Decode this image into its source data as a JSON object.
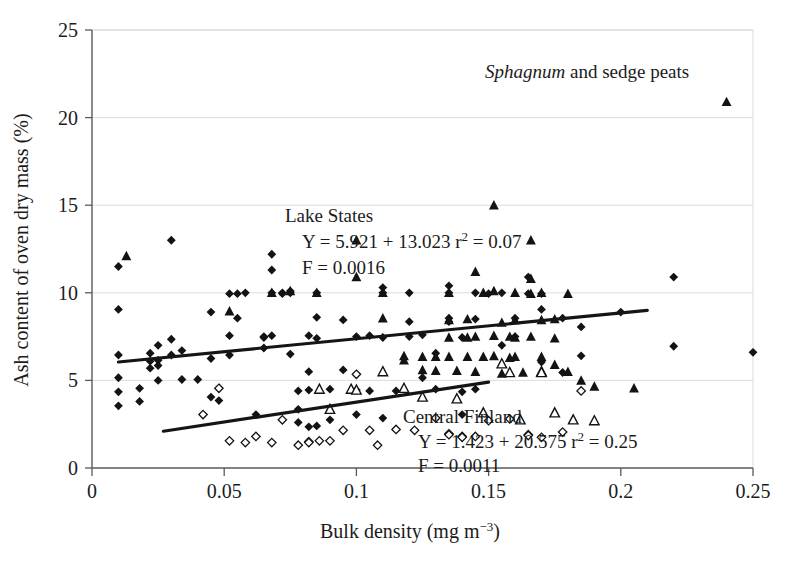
{
  "chart_data": {
    "type": "scatter",
    "title": "Sphagnum and sedge peats",
    "title_italic_word": "Sphagnum",
    "title_rest": " and sedge peats",
    "xlabel": "Bulk density (mg m−3)",
    "xlabel_base": "Bulk density (mg m",
    "xlabel_sup": "−3",
    "xlabel_tail": ")",
    "ylabel": "Ash content of oven dry mass (%)",
    "xlim": [
      0,
      0.25
    ],
    "ylim": [
      0,
      25
    ],
    "xticks": [
      0,
      0.05,
      0.1,
      0.15,
      0.2,
      0.25
    ],
    "xtick_labels": [
      "0",
      "0.05",
      "0.1",
      "0.15",
      "0.2",
      "0.25"
    ],
    "yticks": [
      0,
      5,
      10,
      15,
      20,
      25
    ],
    "ytick_labels": [
      "0",
      "5",
      "10",
      "15",
      "20",
      "25"
    ],
    "grid": "horizontal",
    "legend_position": "none",
    "annotations": [
      {
        "name": "lake-states",
        "lines": [
          "Lake States",
          "Y = 5.921 + 13.023  r2 = 0.07",
          "F = 0.0016"
        ],
        "label": "Lake States",
        "equation_prefix": "Y = 5.921 + 13.023  r",
        "equation_sup": "2",
        "equation_suffix": " = 0.07",
        "fstat": "F = 0.0016",
        "intercept": 5.921,
        "slope": 13.023,
        "r2": 0.07,
        "F": 0.0016
      },
      {
        "name": "central-finland",
        "lines": [
          "Central Finland",
          "Y = 1.423 + 20.575  r2 = 0.25",
          "F = 0.0011"
        ],
        "label": "Central Finland",
        "equation_prefix": "Y = 1.423 + 20.575  r",
        "equation_sup": "2",
        "equation_suffix": " = 0.25",
        "fstat": "F = 0.0011",
        "intercept": 1.423,
        "slope": 20.575,
        "r2": 0.25,
        "F": 0.0011
      }
    ],
    "trendlines": [
      {
        "name": "lake-states-fit",
        "x": [
          0.01,
          0.21
        ],
        "y": [
          6.05,
          9.0
        ]
      },
      {
        "name": "central-finland-fit",
        "x": [
          0.027,
          0.15
        ],
        "y": [
          2.1,
          4.9
        ]
      }
    ],
    "series": [
      {
        "name": "Lake States ash (filled diamond)",
        "marker": "filled-diamond",
        "points": [
          [
            0.01,
            11.5
          ],
          [
            0.01,
            9.05
          ],
          [
            0.01,
            6.45
          ],
          [
            0.01,
            5.15
          ],
          [
            0.01,
            4.35
          ],
          [
            0.01,
            3.55
          ],
          [
            0.018,
            4.55
          ],
          [
            0.018,
            3.8
          ],
          [
            0.022,
            6.55
          ],
          [
            0.022,
            6.1
          ],
          [
            0.022,
            5.7
          ],
          [
            0.025,
            7.0
          ],
          [
            0.025,
            6.15
          ],
          [
            0.025,
            5.85
          ],
          [
            0.025,
            5.0
          ],
          [
            0.03,
            13.0
          ],
          [
            0.03,
            7.35
          ],
          [
            0.03,
            6.45
          ],
          [
            0.034,
            6.7
          ],
          [
            0.034,
            5.05
          ],
          [
            0.04,
            5.05
          ],
          [
            0.045,
            8.9
          ],
          [
            0.045,
            6.25
          ],
          [
            0.045,
            4.05
          ],
          [
            0.048,
            3.85
          ],
          [
            0.052,
            9.95
          ],
          [
            0.052,
            7.55
          ],
          [
            0.052,
            6.45
          ],
          [
            0.055,
            9.95
          ],
          [
            0.055,
            8.55
          ],
          [
            0.058,
            10.0
          ],
          [
            0.062,
            3.05
          ],
          [
            0.065,
            7.5
          ],
          [
            0.065,
            7.45
          ],
          [
            0.065,
            6.85
          ],
          [
            0.068,
            12.2
          ],
          [
            0.068,
            11.3
          ],
          [
            0.068,
            10.0
          ],
          [
            0.068,
            7.55
          ],
          [
            0.072,
            10.0
          ],
          [
            0.072,
            9.95
          ],
          [
            0.075,
            10.1
          ],
          [
            0.075,
            10.0
          ],
          [
            0.075,
            6.5
          ],
          [
            0.078,
            4.4
          ],
          [
            0.078,
            3.35
          ],
          [
            0.078,
            2.6
          ],
          [
            0.082,
            7.55
          ],
          [
            0.082,
            5.5
          ],
          [
            0.082,
            4.45
          ],
          [
            0.082,
            2.35
          ],
          [
            0.085,
            10.0
          ],
          [
            0.085,
            8.6
          ],
          [
            0.085,
            7.4
          ],
          [
            0.085,
            2.4
          ],
          [
            0.09,
            4.5
          ],
          [
            0.09,
            2.75
          ],
          [
            0.095,
            8.45
          ],
          [
            0.095,
            5.6
          ],
          [
            0.1,
            7.5
          ],
          [
            0.1,
            4.45
          ],
          [
            0.1,
            3.05
          ],
          [
            0.105,
            7.55
          ],
          [
            0.105,
            4.4
          ],
          [
            0.11,
            10.3
          ],
          [
            0.11,
            10.0
          ],
          [
            0.11,
            7.45
          ],
          [
            0.11,
            2.85
          ],
          [
            0.115,
            4.4
          ],
          [
            0.115,
            2.2
          ],
          [
            0.12,
            10.0
          ],
          [
            0.12,
            8.35
          ],
          [
            0.12,
            7.5
          ],
          [
            0.125,
            7.6
          ],
          [
            0.125,
            5.15
          ],
          [
            0.13,
            6.55
          ],
          [
            0.13,
            4.5
          ],
          [
            0.135,
            10.4
          ],
          [
            0.135,
            10.0
          ],
          [
            0.135,
            8.55
          ],
          [
            0.135,
            8.35
          ],
          [
            0.14,
            7.45
          ],
          [
            0.14,
            4.35
          ],
          [
            0.14,
            3.05
          ],
          [
            0.145,
            10.0
          ],
          [
            0.145,
            8.5
          ],
          [
            0.145,
            4.5
          ],
          [
            0.15,
            9.95
          ],
          [
            0.155,
            10.0
          ],
          [
            0.155,
            7.0
          ],
          [
            0.16,
            8.55
          ],
          [
            0.16,
            7.5
          ],
          [
            0.165,
            10.9
          ],
          [
            0.165,
            9.95
          ],
          [
            0.17,
            9.95
          ],
          [
            0.17,
            9.05
          ],
          [
            0.17,
            6.05
          ],
          [
            0.178,
            8.55
          ],
          [
            0.178,
            5.45
          ],
          [
            0.185,
            8.05
          ],
          [
            0.185,
            6.4
          ],
          [
            0.2,
            8.9
          ],
          [
            0.22,
            10.9
          ],
          [
            0.22,
            6.95
          ],
          [
            0.25,
            6.6
          ]
        ]
      },
      {
        "name": "Central Finland ash (filled triangle)",
        "marker": "filled-triangle",
        "points": [
          [
            0.013,
            12.1
          ],
          [
            0.052,
            8.95
          ],
          [
            0.068,
            10.0
          ],
          [
            0.075,
            10.1
          ],
          [
            0.085,
            10.0
          ],
          [
            0.1,
            13.0
          ],
          [
            0.1,
            10.9
          ],
          [
            0.11,
            10.0
          ],
          [
            0.11,
            8.55
          ],
          [
            0.118,
            6.4
          ],
          [
            0.118,
            6.15
          ],
          [
            0.125,
            6.35
          ],
          [
            0.125,
            5.6
          ],
          [
            0.13,
            6.35
          ],
          [
            0.13,
            5.55
          ],
          [
            0.135,
            10.0
          ],
          [
            0.135,
            8.45
          ],
          [
            0.135,
            7.45
          ],
          [
            0.135,
            6.35
          ],
          [
            0.138,
            5.55
          ],
          [
            0.142,
            8.5
          ],
          [
            0.142,
            7.45
          ],
          [
            0.142,
            6.35
          ],
          [
            0.145,
            11.2
          ],
          [
            0.145,
            7.5
          ],
          [
            0.145,
            5.5
          ],
          [
            0.148,
            10.0
          ],
          [
            0.148,
            6.35
          ],
          [
            0.152,
            15.0
          ],
          [
            0.152,
            10.1
          ],
          [
            0.152,
            7.55
          ],
          [
            0.152,
            6.4
          ],
          [
            0.155,
            8.3
          ],
          [
            0.155,
            5.4
          ],
          [
            0.158,
            7.5
          ],
          [
            0.158,
            6.3
          ],
          [
            0.16,
            10.0
          ],
          [
            0.16,
            8.45
          ],
          [
            0.16,
            7.45
          ],
          [
            0.16,
            6.35
          ],
          [
            0.163,
            5.45
          ],
          [
            0.166,
            13.0
          ],
          [
            0.166,
            10.8
          ],
          [
            0.166,
            9.95
          ],
          [
            0.166,
            7.5
          ],
          [
            0.17,
            10.0
          ],
          [
            0.17,
            8.45
          ],
          [
            0.17,
            6.35
          ],
          [
            0.175,
            8.5
          ],
          [
            0.175,
            7.4
          ],
          [
            0.175,
            5.9
          ],
          [
            0.18,
            9.95
          ],
          [
            0.18,
            5.5
          ],
          [
            0.185,
            5.0
          ],
          [
            0.19,
            4.65
          ],
          [
            0.205,
            4.55
          ],
          [
            0.24,
            20.9
          ]
        ]
      },
      {
        "name": "Lake States ash low (open diamond)",
        "marker": "open-diamond",
        "points": [
          [
            0.042,
            3.05
          ],
          [
            0.048,
            4.55
          ],
          [
            0.052,
            1.55
          ],
          [
            0.058,
            1.45
          ],
          [
            0.062,
            1.8
          ],
          [
            0.068,
            1.45
          ],
          [
            0.072,
            2.75
          ],
          [
            0.078,
            1.3
          ],
          [
            0.082,
            1.5
          ],
          [
            0.082,
            1.45
          ],
          [
            0.086,
            1.55
          ],
          [
            0.09,
            1.55
          ],
          [
            0.095,
            2.15
          ],
          [
            0.1,
            5.35
          ],
          [
            0.105,
            2.15
          ],
          [
            0.108,
            1.3
          ],
          [
            0.115,
            2.2
          ],
          [
            0.122,
            2.15
          ],
          [
            0.13,
            2.85
          ],
          [
            0.135,
            1.95
          ],
          [
            0.135,
            1.9
          ],
          [
            0.14,
            1.8
          ],
          [
            0.14,
            1.75
          ],
          [
            0.145,
            1.8
          ],
          [
            0.15,
            2.7
          ],
          [
            0.158,
            2.8
          ],
          [
            0.165,
            1.9
          ],
          [
            0.165,
            1.85
          ],
          [
            0.17,
            1.75
          ],
          [
            0.178,
            2.05
          ],
          [
            0.185,
            4.4
          ]
        ]
      },
      {
        "name": "Central Finland ash low (open triangle)",
        "marker": "open-triangle",
        "points": [
          [
            0.086,
            4.5
          ],
          [
            0.09,
            3.35
          ],
          [
            0.098,
            4.5
          ],
          [
            0.1,
            4.45
          ],
          [
            0.11,
            5.5
          ],
          [
            0.118,
            4.55
          ],
          [
            0.125,
            4.05
          ],
          [
            0.138,
            3.95
          ],
          [
            0.148,
            3.15
          ],
          [
            0.155,
            5.95
          ],
          [
            0.158,
            5.45
          ],
          [
            0.162,
            2.75
          ],
          [
            0.17,
            5.5
          ],
          [
            0.17,
            5.45
          ],
          [
            0.175,
            3.15
          ],
          [
            0.182,
            2.75
          ],
          [
            0.19,
            2.7
          ]
        ]
      }
    ]
  }
}
